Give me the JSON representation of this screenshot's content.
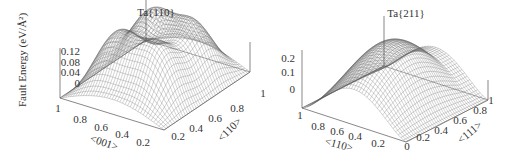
{
  "chart_data": [
    {
      "type": "surface",
      "title": "Ta{110}",
      "zlabel": "Fault Energy (eV/Å²)",
      "xlabel": "<001>",
      "ylabel": "<110>",
      "x_ticks": [
        "1",
        "0.8",
        "0.6",
        "0.4",
        "0.2"
      ],
      "y_ticks": [
        "0.2",
        "0.4",
        "0.6",
        "0.8"
      ],
      "z_ticks": [
        "0.12",
        "0.08",
        "0.04",
        "0"
      ],
      "xlim": [
        0,
        1
      ],
      "ylim": [
        0,
        1
      ],
      "zlim": [
        0,
        0.14
      ],
      "z_min": 0,
      "z_max_approx": 0.14,
      "grid": false,
      "description": "Doubly periodic gamma-surface with two maxima along <110> and a saddle near the middle; zero at corners"
    },
    {
      "type": "surface",
      "title": "Ta{211}",
      "zlabel": "",
      "xlabel": "<110>",
      "ylabel": "<111>",
      "x_ticks": [
        "1",
        "0.8",
        "0.6",
        "0.4",
        "0.2",
        "0"
      ],
      "y_ticks": [
        "0.2",
        "0.4",
        "0.6",
        "0.8",
        "1"
      ],
      "z_ticks": [
        "0.2",
        "0.1",
        "0"
      ],
      "xlim": [
        0,
        1
      ],
      "ylim": [
        0,
        1
      ],
      "zlim": [
        0,
        0.25
      ],
      "z_min": 0,
      "z_max_approx": 0.25,
      "grid": false,
      "description": "Single broad ridge along <111> peaking near the middle of <110>; zero at edges"
    }
  ],
  "panels": {
    "left": {
      "title": "Ta{110}",
      "zlabel": "Fault Energy (eV/Å²)",
      "xlabel": "<001>",
      "ylabel": "<110>",
      "x_ticks": [
        "1",
        "0.8",
        "0.6",
        "0.4",
        "0.2"
      ],
      "y_ticks": [
        "0.2",
        "0.4",
        "0.6",
        "0.8"
      ],
      "z_ticks": [
        "0.12",
        "0.08",
        "0.04",
        "0"
      ]
    },
    "right": {
      "title": "Ta{211}",
      "xlabel": "<110>",
      "ylabel": "<111>",
      "x_ticks": [
        "1",
        "0.8",
        "0.6",
        "0.4",
        "0.2",
        "0"
      ],
      "y_ticks": [
        "0.2",
        "0.4",
        "0.6",
        "0.8",
        "1"
      ],
      "z_ticks": [
        "0.2",
        "0.1",
        "0"
      ],
      "stray_label": "1"
    }
  },
  "colors": {
    "mesh": "#6a6a6a",
    "axis": "#555555",
    "text": "#333333",
    "background": "#ffffff"
  }
}
